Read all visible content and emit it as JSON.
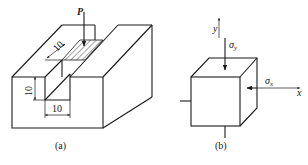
{
  "figure_a": {
    "caption": "(a)",
    "load_label": "P",
    "dim_width_top": "10",
    "dim_height": "10",
    "dim_width_bottom": "10"
  },
  "figure_b": {
    "caption": "(b)",
    "axis_y": "y",
    "axis_x": "x",
    "stress_y": "σ",
    "stress_y_sub": "y",
    "stress_x": "σ",
    "stress_x_sub": "x"
  }
}
